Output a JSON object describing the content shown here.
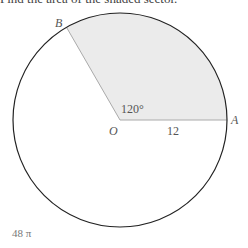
{
  "header": {
    "partial_text": "Find the area of the shaded sector."
  },
  "diagram": {
    "center": {
      "x": 120,
      "y": 120
    },
    "radius": 107,
    "sector_angle_label": "120°",
    "radius_label": "12",
    "points": {
      "center_label": "O",
      "a_label": "A",
      "b_label": "B"
    },
    "colors": {
      "circle_stroke": "#222222",
      "sector_fill": "#ebebeb",
      "sector_edge": "#aaaaaa"
    }
  },
  "answer": {
    "text": "48 π"
  }
}
